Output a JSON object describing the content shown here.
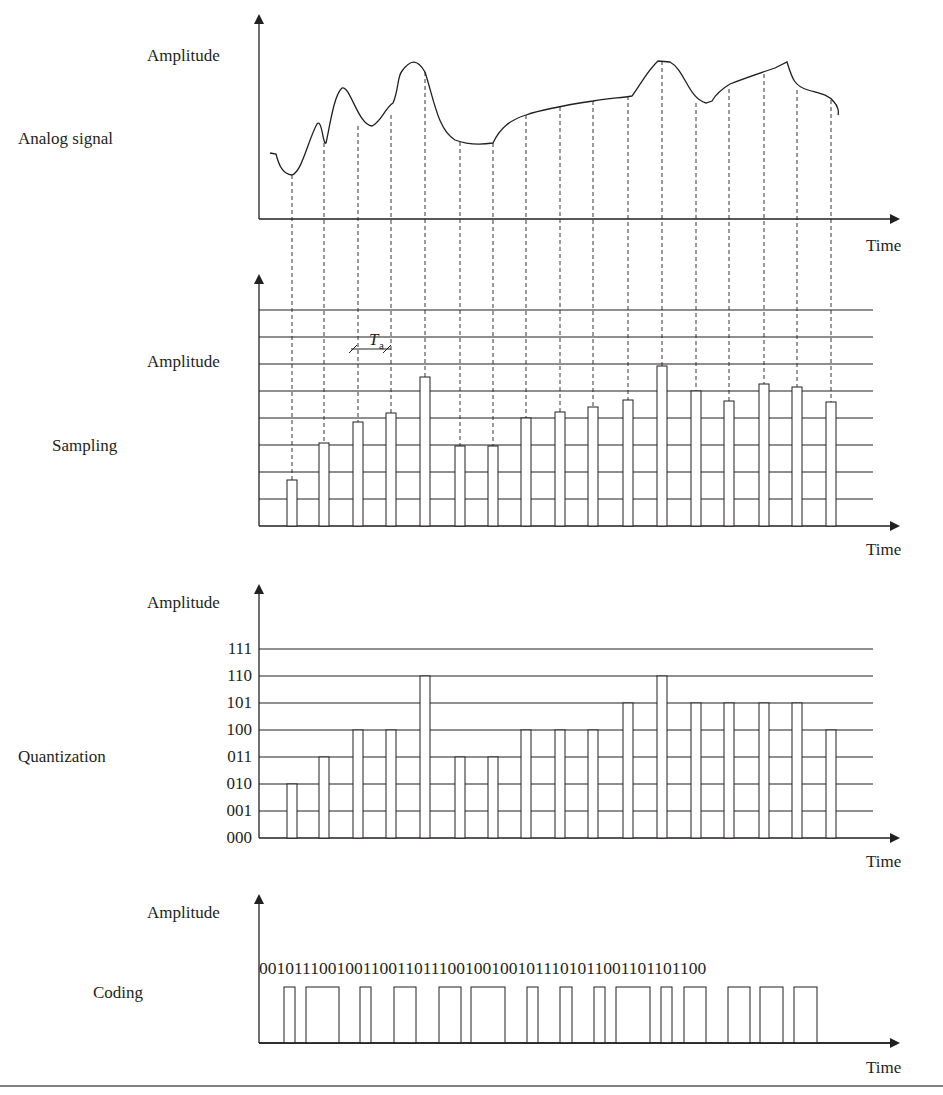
{
  "labels": {
    "amplitude": "Amplitude",
    "time": "Time",
    "analog": "Analog signal",
    "sampling": "Sampling",
    "quantization": "Quantization",
    "coding": "Coding",
    "period_T": "T",
    "period_sub": "a"
  },
  "colors": {
    "ink": "#231f20",
    "grid": "#3a3a3a"
  },
  "sample_x": [
    292,
    324,
    358,
    391,
    425,
    460,
    493,
    526,
    560,
    593,
    628,
    662,
    696,
    729,
    764,
    797,
    831
  ],
  "analog_path": "M270,153 L276,154 C279,166 283,174 292,175 C302,172 308,140 317,124 C322,118 323,146 326,143 C330,125 334,95 342,88 C350,85 358,125 372,126 C381,122 385,108 393,103 C399,89 397,77 402,71 C410,60 417,58 425,72 C434,100 438,130 455,140 C468,145 480,145 493,143 C500,128 510,120 526,115 C540,110 560,106 593,101 C610,98 620,98 632,96 C640,85 648,70 658,61 L670,62 C685,70 688,98 706,103 L712,101 C716,94 720,90 730,84 C745,78 760,73 775,68 L787,62 C792,78 794,86 808,90 C818,93 828,94 834,102 C838,106 839,112 838,115",
  "sampling": {
    "grid_y": [
      310,
      337,
      364,
      391,
      418,
      445,
      472,
      499
    ],
    "base_y": 526,
    "heights_y": [
      480,
      443,
      422,
      413,
      377,
      446,
      446,
      418,
      412,
      407,
      400,
      366,
      391,
      401,
      384,
      387,
      402
    ],
    "level_count": 8
  },
  "quantization": {
    "levels": [
      "000",
      "001",
      "010",
      "011",
      "100",
      "101",
      "110",
      "111"
    ],
    "level_y": [
      838,
      811,
      784,
      757,
      730,
      703,
      676,
      649
    ],
    "codes": [
      "010",
      "011",
      "100",
      "100",
      "110",
      "011",
      "011",
      "100",
      "100",
      "100",
      "101",
      "110",
      "101",
      "101",
      "101",
      "101",
      "100"
    ]
  },
  "coding": {
    "bitstring": "0010111001001100110111001001001011101011001101101100",
    "pulses": [
      [
        284,
        295
      ],
      [
        306,
        339
      ],
      [
        360,
        371
      ],
      [
        394,
        416
      ],
      [
        439,
        461
      ],
      [
        471,
        505
      ],
      [
        527,
        538
      ],
      [
        560,
        572
      ],
      [
        594,
        605
      ],
      [
        616,
        650
      ],
      [
        661,
        672
      ],
      [
        684,
        706
      ],
      [
        728,
        750
      ],
      [
        760,
        783
      ],
      [
        794,
        817
      ]
    ],
    "top_y": 987,
    "base_y": 1043
  },
  "chart_data": {
    "type": "diagram",
    "panels": [
      {
        "name": "Analog signal",
        "ylabel": "Amplitude",
        "xlabel": "Time"
      },
      {
        "name": "Sampling",
        "ylabel": "Amplitude",
        "xlabel": "Time",
        "sample_period_label": "Ta",
        "samples": 17
      },
      {
        "name": "Quantization",
        "ylabel": "Amplitude",
        "xlabel": "Time",
        "levels": [
          "000",
          "001",
          "010",
          "011",
          "100",
          "101",
          "110",
          "111"
        ],
        "values": [
          "010",
          "011",
          "100",
          "100",
          "110",
          "011",
          "011",
          "100",
          "100",
          "100",
          "101",
          "110",
          "101",
          "101",
          "101",
          "101",
          "100"
        ]
      },
      {
        "name": "Coding",
        "ylabel": "Amplitude",
        "xlabel": "Time",
        "bitstring": "0010111001001100110111001001001011101011001101101100"
      }
    ]
  }
}
